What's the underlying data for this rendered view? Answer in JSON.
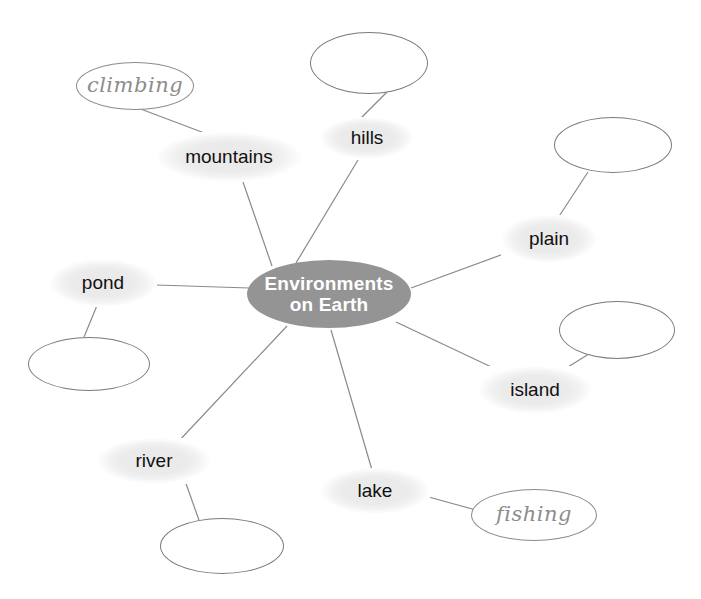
{
  "diagram": {
    "title": "Environments on Earth",
    "type": "mind-map",
    "canvas": {
      "width": 701,
      "height": 599,
      "background": "#ffffff"
    },
    "colors": {
      "center_fill": "#949494",
      "center_text": "#ffffff",
      "topic_fill": "#ebebeb",
      "topic_text": "#111111",
      "blank_stroke": "#7a7a7a",
      "script_stroke": "#8c8c8c",
      "script_text": "#8c8c8c",
      "edge_stroke": "#8a8a8a"
    }
  },
  "center": {
    "label": "Environments\non Earth",
    "cx": 329,
    "cy": 294,
    "rx": 82,
    "ry": 34
  },
  "topics": [
    {
      "id": "mountains",
      "label": "mountains",
      "cx": 229,
      "cy": 157,
      "rx": 73,
      "ry": 25
    },
    {
      "id": "hills",
      "label": "hills",
      "cx": 367,
      "cy": 138,
      "rx": 47,
      "ry": 21
    },
    {
      "id": "plain",
      "label": "plain",
      "cx": 549,
      "cy": 239,
      "rx": 48,
      "ry": 24
    },
    {
      "id": "pond",
      "label": "pond",
      "cx": 103,
      "cy": 283,
      "rx": 54,
      "ry": 24
    },
    {
      "id": "island",
      "label": "island",
      "cx": 535,
      "cy": 390,
      "rx": 57,
      "ry": 24
    },
    {
      "id": "river",
      "label": "river",
      "cx": 154,
      "cy": 461,
      "rx": 57,
      "ry": 23
    },
    {
      "id": "lake",
      "label": "lake",
      "cx": 375,
      "cy": 491,
      "rx": 55,
      "ry": 23
    }
  ],
  "details": [
    {
      "id": "climbing",
      "label": "climbing",
      "style": "script",
      "cx": 135,
      "cy": 86,
      "rx": 59,
      "ry": 24,
      "parent": "mountains"
    },
    {
      "id": "fishing",
      "label": "fishing",
      "style": "script",
      "cx": 534,
      "cy": 515,
      "rx": 63,
      "ry": 26,
      "parent": "lake"
    },
    {
      "id": "blank-hills",
      "label": "",
      "style": "blank",
      "cx": 369,
      "cy": 63,
      "rx": 59,
      "ry": 31,
      "parent": "hills"
    },
    {
      "id": "blank-plain",
      "label": "",
      "style": "blank",
      "cx": 613,
      "cy": 145,
      "rx": 59,
      "ry": 28,
      "parent": "plain"
    },
    {
      "id": "blank-island",
      "label": "",
      "style": "blank",
      "cx": 617,
      "cy": 330,
      "rx": 58,
      "ry": 29,
      "parent": "island"
    },
    {
      "id": "blank-pond",
      "label": "",
      "style": "blank",
      "cx": 89,
      "cy": 364,
      "rx": 61,
      "ry": 27,
      "parent": "pond"
    },
    {
      "id": "blank-river",
      "label": "",
      "style": "blank",
      "cx": 222,
      "cy": 546,
      "rx": 62,
      "ry": 28,
      "parent": "river"
    }
  ],
  "edges": [
    {
      "from": "center",
      "to": "mountains",
      "x1": 272,
      "y1": 266,
      "x2": 243,
      "y2": 182
    },
    {
      "from": "center",
      "to": "hills",
      "x1": 296,
      "y1": 263,
      "x2": 358,
      "y2": 160
    },
    {
      "from": "center",
      "to": "plain",
      "x1": 411,
      "y1": 288,
      "x2": 509,
      "y2": 252
    },
    {
      "from": "center",
      "to": "pond",
      "x1": 249,
      "y1": 288,
      "x2": 156,
      "y2": 285
    },
    {
      "from": "center",
      "to": "island",
      "x1": 396,
      "y1": 322,
      "x2": 502,
      "y2": 372
    },
    {
      "from": "center",
      "to": "river",
      "x1": 287,
      "y1": 326,
      "x2": 177,
      "y2": 443
    },
    {
      "from": "center",
      "to": "lake",
      "x1": 331,
      "y1": 330,
      "x2": 372,
      "y2": 470
    },
    {
      "from": "mountains",
      "to": "climbing",
      "x1": 215,
      "y1": 137,
      "x2": 138,
      "y2": 108
    },
    {
      "from": "hills",
      "to": "blank-hills",
      "x1": 360,
      "y1": 119,
      "x2": 387,
      "y2": 92
    },
    {
      "from": "plain",
      "to": "blank-plain",
      "x1": 556,
      "y1": 221,
      "x2": 588,
      "y2": 172
    },
    {
      "from": "island",
      "to": "blank-island",
      "x1": 560,
      "y1": 372,
      "x2": 592,
      "y2": 352
    },
    {
      "from": "pond",
      "to": "blank-pond",
      "x1": 98,
      "y1": 303,
      "x2": 84,
      "y2": 337
    },
    {
      "from": "river",
      "to": "blank-river",
      "x1": 184,
      "y1": 478,
      "x2": 200,
      "y2": 523
    },
    {
      "from": "lake",
      "to": "fishing",
      "x1": 425,
      "y1": 496,
      "x2": 476,
      "y2": 510
    }
  ]
}
